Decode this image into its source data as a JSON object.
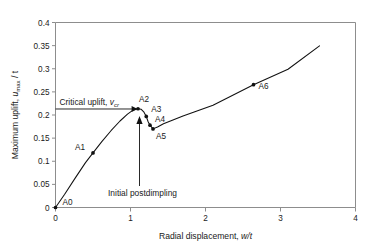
{
  "figure": {
    "background": "#ffffff",
    "curve_color": "#111111",
    "axis_color": "#8d8d8d",
    "text_color": "#1a1a1a"
  },
  "axes": {
    "x": {
      "label_prefix": "Radial displacement, ",
      "label_italic": "w/t",
      "ticks": [
        "0",
        "1",
        "2",
        "3",
        "4"
      ],
      "min": 0,
      "max": 4
    },
    "y": {
      "label_prefix": "Maximum uplift, ",
      "label_italic": "u",
      "label_sub": "max",
      "label_suffix": " / t",
      "ticks": [
        "0",
        "0.05",
        "0.1",
        "0.15",
        "0.2",
        "0.25",
        "0.3",
        "0.35",
        "0.4"
      ],
      "min": 0,
      "max": 0.4
    }
  },
  "annotations": {
    "critical_uplift": {
      "text_prefix": "Critical uplift, ",
      "text_italic": "v",
      "text_sub": "cr",
      "value": 0.213
    },
    "initial_postdimpling": {
      "text": "Initial postdimpling",
      "target_x": 1.12,
      "target_y": 0.198
    }
  },
  "chart_data": {
    "type": "line",
    "title": "",
    "xlabel": "Radial displacement, w/t",
    "ylabel": "Maximum uplift, umax / t",
    "xlim": [
      0,
      4
    ],
    "ylim": [
      0,
      0.4
    ],
    "grid": false,
    "legend": "none",
    "series": [
      {
        "name": "load-displacement path",
        "x": [
          0.0,
          0.12,
          0.26,
          0.4,
          0.5,
          0.62,
          0.74,
          0.86,
          0.96,
          1.02,
          1.06,
          1.1,
          1.14,
          1.18,
          1.21,
          1.235,
          1.26,
          1.3,
          1.36,
          1.44,
          1.7,
          2.1,
          2.64,
          3.1,
          3.52
        ],
        "y": [
          0.0,
          0.028,
          0.063,
          0.097,
          0.118,
          0.143,
          0.166,
          0.187,
          0.202,
          0.209,
          0.2125,
          0.2135,
          0.2125,
          0.206,
          0.197,
          0.1855,
          0.178,
          0.17,
          0.174,
          0.181,
          0.198,
          0.221,
          0.2655,
          0.299,
          0.3495
        ]
      }
    ],
    "points": [
      {
        "label": "A0",
        "x": 0.0,
        "y": 0.0,
        "label_dx": 7,
        "label_dy": -3
      },
      {
        "label": "A1",
        "x": 0.5,
        "y": 0.118,
        "label_dx": -18,
        "label_dy": -3
      },
      {
        "label": "A2",
        "x": 1.1,
        "y": 0.2135,
        "label_dx": 1,
        "label_dy": -7
      },
      {
        "label": "A3",
        "x": 1.21,
        "y": 0.197,
        "label_dx": 5,
        "label_dy": -4
      },
      {
        "label": "A4",
        "x": 1.26,
        "y": 0.178,
        "label_dx": 5,
        "label_dy": -3
      },
      {
        "label": "A5",
        "x": 1.3,
        "y": 0.17,
        "label_dx": 3,
        "label_dy": 10
      },
      {
        "label": "A6",
        "x": 2.64,
        "y": 0.2655,
        "label_dx": 5,
        "label_dy": 4
      }
    ]
  }
}
